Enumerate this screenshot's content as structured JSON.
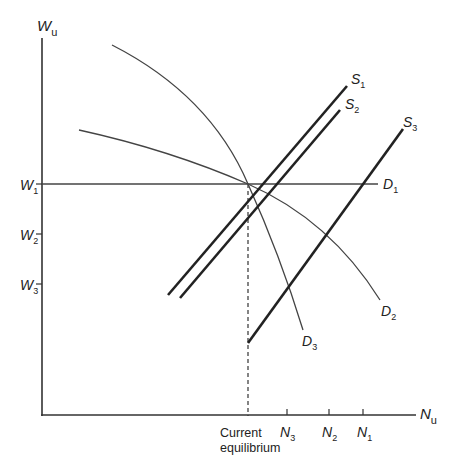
{
  "diagram": {
    "type": "labour-market supply and demand",
    "axes": {
      "y_label": {
        "main": "W",
        "sub": "u"
      },
      "x_label": {
        "main": "N",
        "sub": "u"
      }
    },
    "y_ticks": [
      {
        "main": "W",
        "sub": "1"
      },
      {
        "main": "W",
        "sub": "2"
      },
      {
        "main": "W",
        "sub": "3"
      }
    ],
    "x_ticks": [
      {
        "main": "N",
        "sub": "3"
      },
      {
        "main": "N",
        "sub": "2"
      },
      {
        "main": "N",
        "sub": "1"
      }
    ],
    "equilibrium_label": {
      "line1": "Current",
      "line2": "equilibrium"
    },
    "supply_curves": [
      {
        "main": "S",
        "sub": "1"
      },
      {
        "main": "S",
        "sub": "2"
      },
      {
        "main": "S",
        "sub": "3"
      }
    ],
    "demand_curves": [
      {
        "main": "D",
        "sub": "1"
      },
      {
        "main": "D",
        "sub": "2"
      },
      {
        "main": "D",
        "sub": "3"
      }
    ],
    "colors": {
      "line": "#222222",
      "background": "#ffffff"
    }
  }
}
